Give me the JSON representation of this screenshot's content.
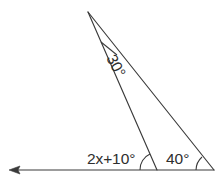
{
  "figure": {
    "background_color": "#ffffff",
    "line_color": "#3a3a3a",
    "text_color": "#2e2e2e",
    "labels": {
      "apex_angle": "30°",
      "interior_left_angle": "2x+10°",
      "right_angle": "40°"
    },
    "points": {
      "apex": {
        "x": 88,
        "y": 12,
        "name": "apex-vertex"
      },
      "base_middle": {
        "x": 157,
        "y": 170,
        "name": "base-middle-vertex"
      },
      "base_right": {
        "x": 214,
        "y": 170,
        "name": "base-right-vertex"
      },
      "ray_arrow_tip": {
        "x": 9,
        "y": 170,
        "name": "ray-arrow-tip"
      }
    },
    "elements": {
      "apex_tick_name": "apex-angle-tick",
      "arc_middle_name": "angle-arc-middle",
      "arc_right_name": "angle-arc-right",
      "segment_apex_to_middle": "segment-apex-base-middle",
      "segment_apex_to_right": "segment-apex-base-right",
      "base_ray": "base-ray-horizontal"
    },
    "rotations": {
      "apex_label_deg": 62
    }
  }
}
